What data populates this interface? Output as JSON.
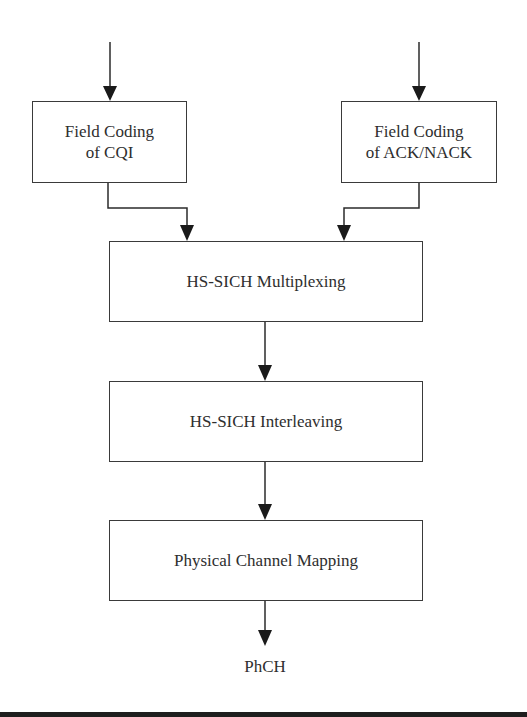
{
  "diagram": {
    "title": "",
    "nodes": [
      {
        "id": "cqi",
        "label": "Field Coding\nof CQI",
        "x": 32,
        "y": 101,
        "w": 155,
        "h": 82
      },
      {
        "id": "ack",
        "label": "Field Coding\nof ACK/NACK",
        "x": 341,
        "y": 101,
        "w": 156,
        "h": 82
      },
      {
        "id": "mux",
        "label": "HS-SICH Multiplexing",
        "x": 109,
        "y": 241,
        "w": 314,
        "h": 81
      },
      {
        "id": "intl",
        "label": "HS-SICH Interleaving",
        "x": 109,
        "y": 381,
        "w": 314,
        "h": 81
      },
      {
        "id": "map",
        "label": "Physical Channel Mapping",
        "x": 109,
        "y": 520,
        "w": 314,
        "h": 81
      }
    ],
    "output_label": "PhCH",
    "edges": [
      {
        "from": "input-left",
        "to": "cqi"
      },
      {
        "from": "input-right",
        "to": "ack"
      },
      {
        "from": "cqi",
        "to": "mux"
      },
      {
        "from": "ack",
        "to": "mux"
      },
      {
        "from": "mux",
        "to": "intl"
      },
      {
        "from": "intl",
        "to": "map"
      },
      {
        "from": "map",
        "to": "PhCH"
      }
    ],
    "colors": {
      "line": "#2b2b2b",
      "background": "#ffffff",
      "bottom_bar": "#1e1e1e"
    }
  }
}
